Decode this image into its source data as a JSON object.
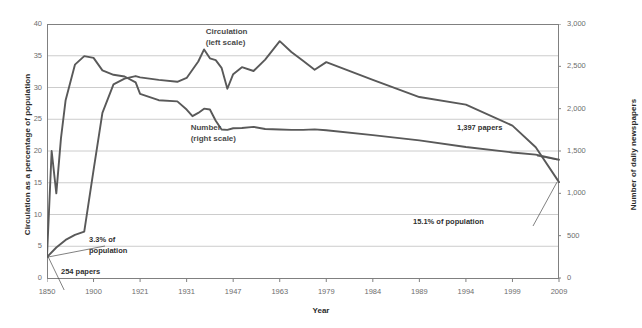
{
  "chart_data": {
    "type": "line",
    "title": "",
    "xlabel": "Year",
    "ylabel": "Circulation as a percentage of population",
    "y2label": "Number of daily newspapers",
    "xlim": [
      1850,
      2009
    ],
    "ylim": [
      0,
      40
    ],
    "y2lim": [
      0,
      3000
    ],
    "grid": true,
    "legend_position": "inline-annotations",
    "x_ticks": [
      "1850",
      "1900",
      "1921",
      "1931",
      "1947",
      "1963",
      "1979",
      "1984",
      "1989",
      "1994",
      "1999",
      "2009"
    ],
    "x_tick_values": [
      1850,
      1900,
      1921,
      1931,
      1947,
      1963,
      1979,
      1984,
      1989,
      1994,
      1999,
      2009
    ],
    "y_ticks_left": [
      "0",
      "5",
      "10",
      "15",
      "20",
      "25",
      "30",
      "35",
      "40"
    ],
    "y_tick_values_left": [
      0,
      5,
      10,
      15,
      20,
      25,
      30,
      35,
      40
    ],
    "y_ticks_right": [
      "0",
      "500",
      "1,000",
      "1,500",
      "2,000",
      "2,500",
      "3,000"
    ],
    "y_tick_values_right": [
      0,
      500,
      1000,
      1500,
      2000,
      2500,
      3000
    ],
    "series": [
      {
        "name": "Circulation",
        "axis": "left",
        "units": "percentage of population",
        "color": "#595959",
        "x": [
          1850,
          1860,
          1870,
          1880,
          1890,
          1900,
          1904,
          1909,
          1914,
          1919,
          1921,
          1925,
          1929,
          1931,
          1933,
          1935,
          1937,
          1939,
          1941,
          1943,
          1945,
          1947,
          1950,
          1954,
          1958,
          1963,
          1967,
          1971,
          1975,
          1979,
          1984,
          1989,
          1994,
          1999,
          2004,
          2009
        ],
        "values": [
          3.3,
          4.8,
          6.0,
          6.8,
          7.3,
          17.0,
          26.0,
          30.5,
          31.4,
          31.8,
          31.6,
          31.2,
          30.9,
          31.5,
          32.8,
          34.1,
          36.0,
          34.6,
          34.3,
          33.1,
          29.8,
          32.1,
          33.2,
          32.6,
          34.4,
          37.3,
          35.6,
          34.2,
          32.8,
          34.0,
          31.2,
          28.5,
          27.3,
          24.0,
          20.6,
          15.1
        ]
      },
      {
        "name": "Number",
        "axis": "right",
        "units": "daily newspapers",
        "color": "#595959",
        "x": [
          1850,
          1855,
          1860,
          1865,
          1870,
          1880,
          1890,
          1900,
          1904,
          1909,
          1914,
          1919,
          1921,
          1925,
          1929,
          1931,
          1933,
          1935,
          1937,
          1939,
          1941,
          1943,
          1945,
          1947,
          1950,
          1954,
          1958,
          1963,
          1967,
          1971,
          1975,
          1979,
          1984,
          1989,
          1994,
          1999,
          2004,
          2009
        ],
        "values": [
          254,
          1500,
          1000,
          1650,
          2100,
          2520,
          2620,
          2600,
          2452,
          2400,
          2380,
          2310,
          2175,
          2100,
          2086,
          1990,
          1911,
          1950,
          2000,
          1990,
          1857,
          1754,
          1749,
          1769,
          1772,
          1785,
          1760,
          1754,
          1749,
          1749,
          1756,
          1745,
          1688,
          1626,
          1548,
          1483,
          1457,
          1397
        ]
      }
    ],
    "annotations": [
      {
        "id": "start-papers",
        "text": "254 papers",
        "value": 254
      },
      {
        "id": "start-circulation",
        "text_line1": "3.3% of",
        "text_line2": "population",
        "value": 3.3
      },
      {
        "id": "end-papers",
        "text": "1,397 papers",
        "value": 1397
      },
      {
        "id": "end-circulation",
        "text": "15.1% of population",
        "value": 15.1
      }
    ],
    "series_labels": [
      {
        "id": "circulation",
        "line1": "Circulation",
        "line2": "(left scale)"
      },
      {
        "id": "number",
        "line1": "Number",
        "line2": "(right scale)"
      }
    ],
    "colors": {
      "line": "#595959",
      "grid": "#bfbfbf",
      "axis": "#808080",
      "tick_text": "#6d6d6d",
      "title_text": "#2b2b2b",
      "annotation_text": "#2f2f2f",
      "background": "#ffffff"
    }
  }
}
